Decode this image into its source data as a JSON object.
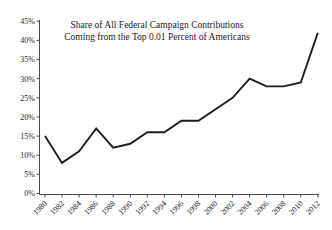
{
  "chart_data": {
    "type": "line",
    "title_line1": "Share of All Federal Campaign Contributions",
    "title_line2": "Coming from the Top 0.01 Percent of Americans",
    "x": [
      1980,
      1982,
      1984,
      1986,
      1988,
      1990,
      1992,
      1994,
      1996,
      1998,
      2000,
      2002,
      2004,
      2006,
      2008,
      2010,
      2012
    ],
    "values": [
      15,
      8,
      11,
      17,
      12,
      13,
      16,
      16,
      19,
      19,
      22,
      25,
      30,
      28,
      28,
      29,
      42
    ],
    "x_tick_labels": [
      "1980",
      "1982",
      "1984",
      "1986",
      "1988",
      "1990",
      "1992",
      "1994",
      "1996",
      "1998",
      "2000",
      "2002",
      "2004",
      "2006",
      "2008",
      "2010",
      "2012"
    ],
    "y_tick_labels": [
      "0%",
      "5%",
      "10%",
      "15%",
      "20%",
      "25%",
      "30%",
      "35%",
      "40%",
      "45%"
    ],
    "ylim": [
      0,
      45
    ],
    "y_tick_step": 5,
    "xlabel": "",
    "ylabel": "",
    "grid": "off",
    "legend": "none",
    "line_color": "#1c1c1c",
    "axis_color": "#4a4a4a",
    "text_color": "#1a1a1a",
    "background": "#ffffff"
  }
}
